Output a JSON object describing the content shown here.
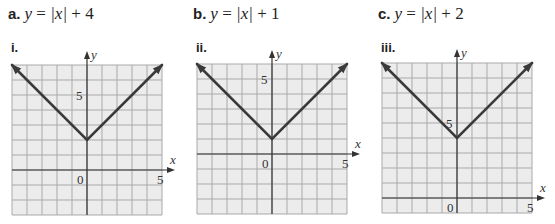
{
  "equations": [
    {
      "letter": "a.",
      "lhs": "y",
      "eq": " = ",
      "abs": "|x|",
      "rhs": " + 4"
    },
    {
      "letter": "b.",
      "lhs": "y",
      "eq": " = ",
      "abs": "|x|",
      "rhs": " + 1"
    },
    {
      "letter": "c.",
      "lhs": "y",
      "eq": " = ",
      "abs": "|x|",
      "rhs": " + 2"
    }
  ],
  "graph_labels": [
    "i.",
    "ii.",
    "iii."
  ],
  "colors": {
    "grid_bg": "#ececec",
    "grid_line": "#a9a9a9",
    "axis": "#333333",
    "curve": "#3a3a3a"
  },
  "chart_data": [
    {
      "type": "line",
      "title": "i.",
      "function": "y = |x| + 2",
      "xlabel": "x",
      "ylabel": "y",
      "xlim": [
        -5,
        5
      ],
      "ylim": [
        -3,
        7
      ],
      "grid": true,
      "x_tick_labels": [
        {
          "value": 0,
          "label": "0"
        },
        {
          "value": 5,
          "label": "5"
        }
      ],
      "y_tick_labels": [
        {
          "value": 5,
          "label": "5"
        }
      ],
      "series": [
        {
          "name": "V",
          "x": [
            -5,
            0,
            5
          ],
          "y": [
            7,
            2,
            7
          ]
        }
      ],
      "vertex": [
        0,
        2
      ]
    },
    {
      "type": "line",
      "title": "ii.",
      "function": "y = |x| + 1",
      "xlabel": "x",
      "ylabel": "y",
      "xlim": [
        -5,
        5
      ],
      "ylim": [
        -4,
        6
      ],
      "grid": true,
      "x_tick_labels": [
        {
          "value": 0,
          "label": "0"
        },
        {
          "value": 5,
          "label": "5"
        }
      ],
      "y_tick_labels": [
        {
          "value": 5,
          "label": "5"
        }
      ],
      "series": [
        {
          "name": "V",
          "x": [
            -5,
            0,
            5
          ],
          "y": [
            6,
            1,
            6
          ]
        }
      ],
      "vertex": [
        0,
        1
      ]
    },
    {
      "type": "line",
      "title": "iii.",
      "function": "y = |x| + 4",
      "xlabel": "x",
      "ylabel": "y",
      "xlim": [
        -5,
        5
      ],
      "ylim": [
        -1,
        9
      ],
      "grid": true,
      "x_tick_labels": [
        {
          "value": 0,
          "label": "0"
        },
        {
          "value": 5,
          "label": "5"
        }
      ],
      "y_tick_labels": [
        {
          "value": 5,
          "label": "5"
        }
      ],
      "series": [
        {
          "name": "V",
          "x": [
            -5,
            0,
            5
          ],
          "y": [
            9,
            4,
            9
          ]
        }
      ],
      "vertex": [
        0,
        4
      ]
    }
  ]
}
